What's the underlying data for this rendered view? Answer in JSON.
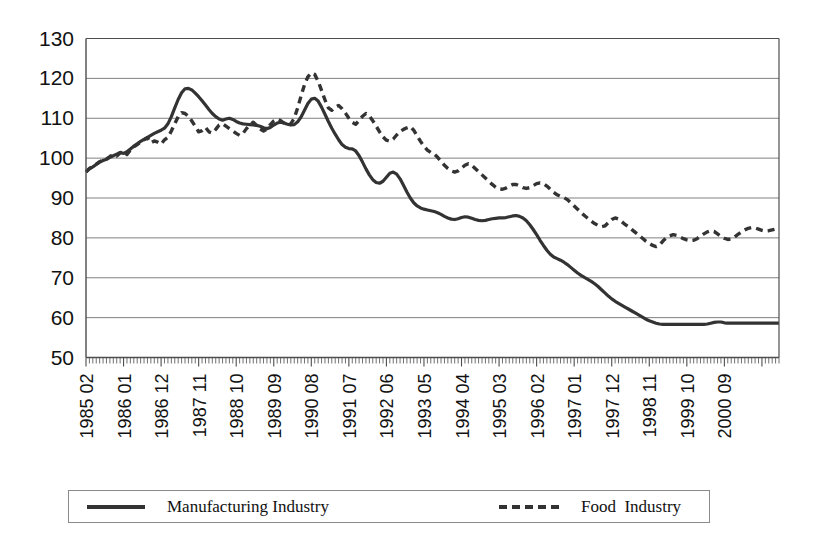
{
  "chart_data": {
    "type": "line",
    "title": "",
    "xlabel": "",
    "ylabel": "",
    "ylim": [
      50,
      130
    ],
    "yticks": [
      50,
      60,
      70,
      80,
      90,
      100,
      110,
      120,
      130
    ],
    "grid": true,
    "legend_position": "bottom",
    "x_tick_labels": [
      "1985 02",
      "1986 01",
      "1986 12",
      "1987 11",
      "1988 10",
      "1989 09",
      "1990 08",
      "1991 07",
      "1992 06",
      "1993 05",
      "1994 04",
      "1995 03",
      "1996 02",
      "1997 01",
      "1997 12",
      "1998 11",
      "1999 10",
      "2000 09"
    ],
    "x_tick_label_interval_months": 11,
    "x_start": "1985 02",
    "x_end": "2000 12",
    "series": [
      {
        "name": "Manufacturing Industry",
        "style": "solid",
        "color": "#333333",
        "values": [
          96.5,
          97.3,
          97.8,
          98.4,
          99.0,
          99.4,
          99.7,
          100.2,
          100.6,
          101.0,
          101.4,
          101.2,
          101.6,
          102.3,
          103.0,
          103.6,
          104.2,
          104.7,
          105.2,
          105.7,
          106.2,
          106.6,
          107.0,
          107.5,
          108.6,
          110.4,
          112.6,
          114.7,
          116.4,
          117.4,
          117.5,
          117.1,
          116.3,
          115.4,
          114.4,
          113.3,
          112.2,
          111.2,
          110.4,
          109.8,
          109.5,
          109.8,
          110.0,
          109.7,
          109.2,
          108.8,
          108.6,
          108.5,
          108.4,
          108.3,
          108.2,
          108.0,
          107.6,
          107.4,
          107.7,
          108.3,
          108.8,
          109.0,
          108.8,
          108.5,
          108.3,
          108.4,
          109.1,
          110.3,
          112.0,
          113.7,
          114.8,
          115.0,
          114.3,
          112.8,
          111.0,
          109.2,
          107.5,
          106.0,
          104.6,
          103.4,
          102.7,
          102.4,
          102.3,
          101.8,
          100.6,
          99.0,
          97.3,
          95.8,
          94.6,
          93.9,
          93.7,
          94.2,
          95.2,
          96.2,
          96.5,
          96.0,
          94.8,
          93.2,
          91.5,
          90.0,
          88.8,
          88.0,
          87.5,
          87.2,
          87.0,
          86.8,
          86.6,
          86.3,
          85.9,
          85.4,
          85.0,
          84.7,
          84.6,
          84.8,
          85.1,
          85.3,
          85.2,
          84.9,
          84.6,
          84.4,
          84.3,
          84.4,
          84.6,
          84.8,
          84.9,
          85.0,
          85.0,
          85.1,
          85.3,
          85.5,
          85.6,
          85.4,
          85.0,
          84.3,
          83.3,
          82.1,
          80.8,
          79.4,
          78.1,
          76.9,
          75.9,
          75.2,
          74.8,
          74.4,
          73.9,
          73.3,
          72.6,
          71.9,
          71.2,
          70.6,
          70.1,
          69.6,
          69.1,
          68.5,
          67.8,
          67.0,
          66.2,
          65.4,
          64.7,
          64.1,
          63.6,
          63.1,
          62.6,
          62.1,
          61.6,
          61.1,
          60.6,
          60.1,
          59.6,
          59.2,
          58.9,
          58.6,
          58.4,
          58.3,
          58.3,
          58.3,
          58.3,
          58.3,
          58.3,
          58.3,
          58.3,
          58.3,
          58.3,
          58.3,
          58.3,
          58.3,
          58.4,
          58.6,
          58.8,
          58.9,
          58.9,
          58.7,
          58.6,
          58.6,
          58.6,
          58.6,
          58.6,
          58.6,
          58.6,
          58.6,
          58.6,
          58.6,
          58.6,
          58.6,
          58.6,
          58.6,
          58.6,
          58.6
        ],
        "min": 58.3,
        "max": 117.5,
        "start_value": 96.5,
        "end_value": 58.6
      },
      {
        "name": "Food  Industry",
        "style": "dashed",
        "color": "#333333",
        "values": [
          96.6,
          97.4,
          97.9,
          98.5,
          99.1,
          99.5,
          99.8,
          100.4,
          100.9,
          100.5,
          101.3,
          101.8,
          100.9,
          102.0,
          102.8,
          103.4,
          104.0,
          104.6,
          105.1,
          103.8,
          104.3,
          104.0,
          103.5,
          104.6,
          105.2,
          106.8,
          108.6,
          110.4,
          111.4,
          111.2,
          110.5,
          109.3,
          108.0,
          106.6,
          106.9,
          107.7,
          106.6,
          106.3,
          107.2,
          108.3,
          108.6,
          108.0,
          107.4,
          106.8,
          106.2,
          105.7,
          106.2,
          107.4,
          108.4,
          109.0,
          108.2,
          107.3,
          106.8,
          107.3,
          108.4,
          109.3,
          109.8,
          109.4,
          108.8,
          108.3,
          108.6,
          110.0,
          112.6,
          115.6,
          118.4,
          120.4,
          121.4,
          121.0,
          119.3,
          117.0,
          114.6,
          112.6,
          112.0,
          112.8,
          113.2,
          112.4,
          111.3,
          110.0,
          109.0,
          108.5,
          109.4,
          110.5,
          111.2,
          110.6,
          109.4,
          108.0,
          106.6,
          105.3,
          104.5,
          104.2,
          104.8,
          105.8,
          106.7,
          107.2,
          107.6,
          107.9,
          107.0,
          105.6,
          104.2,
          103.0,
          102.0,
          101.4,
          101.0,
          100.2,
          99.2,
          98.2,
          97.4,
          96.8,
          96.5,
          96.8,
          97.5,
          98.2,
          98.6,
          98.2,
          97.4,
          96.6,
          95.8,
          95.0,
          94.2,
          93.4,
          92.7,
          92.3,
          92.2,
          92.5,
          93.0,
          93.4,
          93.4,
          93.0,
          92.6,
          92.4,
          92.6,
          93.1,
          93.6,
          93.8,
          93.6,
          93.0,
          92.2,
          91.4,
          90.8,
          90.4,
          90.1,
          89.6,
          88.8,
          88.0,
          87.2,
          86.4,
          85.6,
          84.9,
          84.2,
          83.6,
          83.1,
          82.8,
          83.0,
          83.8,
          84.6,
          85.0,
          84.7,
          84.0,
          83.3,
          82.7,
          82.0,
          81.3,
          80.6,
          79.9,
          79.2,
          78.6,
          78.1,
          77.8,
          78.2,
          79.2,
          80.0,
          80.5,
          80.8,
          80.6,
          80.2,
          79.8,
          79.5,
          79.3,
          79.4,
          79.8,
          80.4,
          81.0,
          81.5,
          81.8,
          81.6,
          81.0,
          80.4,
          79.9,
          79.6,
          79.7,
          80.2,
          80.9,
          81.5,
          82.0,
          82.4,
          82.6,
          82.5,
          82.2,
          81.9,
          81.7,
          81.8,
          82.0,
          82.2,
          82.2
        ],
        "min": 77.8,
        "max": 121.4,
        "start_value": 96.6,
        "end_value": 82.2
      }
    ]
  },
  "legend": {
    "entries": [
      {
        "label": "Manufacturing Industry",
        "style": "solid"
      },
      {
        "label": "Food  Industry",
        "style": "dashed"
      }
    ]
  },
  "colors": {
    "line": "#333333",
    "grid": "#808080",
    "axis": "#4d4d4d",
    "text": "#111111",
    "background": "#ffffff"
  }
}
